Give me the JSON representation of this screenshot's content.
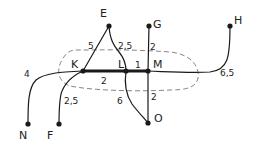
{
  "diagram": {
    "type": "weighted-graph",
    "colors": {
      "ink": "#1a1a1a",
      "background": "#ffffff",
      "dashed_region": "#777777"
    },
    "nodes": [
      {
        "id": "E",
        "label": "E",
        "x": 109,
        "y": 26,
        "lx": 100,
        "ly": 17
      },
      {
        "id": "G",
        "label": "G",
        "x": 149,
        "y": 26,
        "lx": 153,
        "ly": 28
      },
      {
        "id": "H",
        "label": "H",
        "x": 230,
        "y": 26,
        "lx": 234,
        "ly": 24
      },
      {
        "id": "K",
        "label": "K",
        "x": 83,
        "y": 71,
        "lx": 71,
        "ly": 68
      },
      {
        "id": "L",
        "label": "L",
        "x": 126,
        "y": 71,
        "lx": 118,
        "ly": 68
      },
      {
        "id": "M",
        "label": "M",
        "x": 148,
        "y": 71,
        "lx": 153,
        "ly": 68
      },
      {
        "id": "N",
        "label": "N",
        "x": 28,
        "y": 124,
        "lx": 19,
        "ly": 139
      },
      {
        "id": "F",
        "label": "F",
        "x": 59,
        "y": 124,
        "lx": 47,
        "ly": 139
      },
      {
        "id": "O",
        "label": "O",
        "x": 148,
        "y": 123,
        "lx": 154,
        "ly": 122
      }
    ],
    "edges": [
      {
        "from": "K",
        "to": "L",
        "weight": "2",
        "thick": true,
        "wx": 101,
        "wy": 84
      },
      {
        "from": "L",
        "to": "M",
        "weight": "1",
        "thick": true,
        "wx": 135,
        "wy": 68
      },
      {
        "from": "E",
        "to": "K",
        "weight": "5",
        "thick": false,
        "wx": 88,
        "wy": 49
      },
      {
        "from": "E",
        "to": "L",
        "weight": "2,5",
        "thick": false,
        "wx": 118,
        "wy": 49
      },
      {
        "from": "G",
        "to": "M",
        "weight": "2",
        "thick": false,
        "wx": 150,
        "wy": 50
      },
      {
        "from": "M",
        "to": "H",
        "weight": "6,5",
        "thick": false,
        "wx": 220,
        "wy": 76
      },
      {
        "from": "K",
        "to": "N",
        "weight": "4",
        "thick": false,
        "wx": 24,
        "wy": 77
      },
      {
        "from": "K",
        "to": "F",
        "weight": "2,5",
        "thick": false,
        "wx": 64,
        "wy": 104
      },
      {
        "from": "L",
        "to": "O",
        "weight": "6",
        "thick": false,
        "wx": 117,
        "wy": 104
      },
      {
        "from": "M",
        "to": "O",
        "weight": "2",
        "thick": false,
        "wx": 151,
        "wy": 100
      }
    ],
    "region": {
      "shape": "dashed-ellipse",
      "encloses": [
        "K",
        "L",
        "M"
      ]
    }
  }
}
